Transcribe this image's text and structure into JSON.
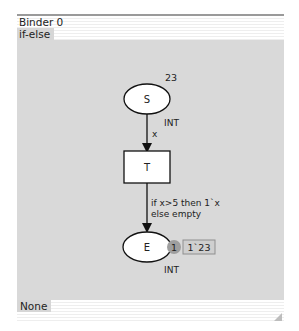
{
  "window": {
    "title": "Binder 0",
    "tab": "if-else",
    "bottom_tab": "None"
  },
  "net": {
    "place_s": {
      "name": "S",
      "marking_count": "23",
      "type": "INT"
    },
    "arc_s_t": {
      "label": "x"
    },
    "transition_t": {
      "name": "T"
    },
    "arc_t_e": {
      "label_line1": "if x>5 then 1`x",
      "label_line2": "else empty"
    },
    "place_e": {
      "name": "E",
      "token_count": "1",
      "marking": "1`23",
      "type": "INT"
    }
  },
  "colors": {
    "canvas": "#d9d9d9",
    "node_fill": "#ffffff",
    "token_badge": "#9e9e9e",
    "marking_box": "#cfcfcf"
  }
}
